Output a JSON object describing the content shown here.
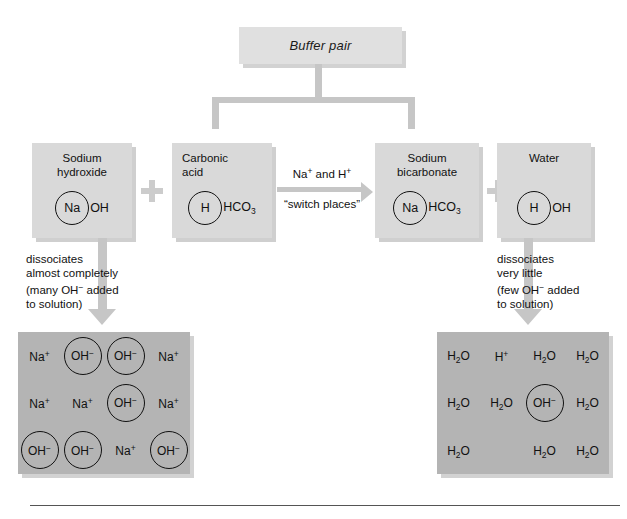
{
  "title": "Buffer pair",
  "banner": {
    "label": "Buffer pair"
  },
  "reactants": [
    {
      "name": "sodium-hydroxide",
      "caption_line1": "Sodium",
      "caption_line2": "hydroxide",
      "ring": "Na",
      "tail": "OH"
    },
    {
      "name": "carbonic-acid",
      "caption_line1": "Carbonic",
      "caption_line2": "acid",
      "ring": "H",
      "tail": "HCO",
      "tail_sub": "3"
    },
    {
      "name": "sodium-bicarbonate",
      "caption_line1": "Sodium",
      "caption_line2": "bicarbonate",
      "ring": "Na",
      "tail": "HCO",
      "tail_sub": "3"
    },
    {
      "name": "water",
      "caption_line1": "Water",
      "caption_line2": "",
      "ring": "H",
      "tail": "OH"
    }
  ],
  "plus_symbols": [
    "+",
    "+"
  ],
  "reaction_arrow": {
    "above_pre": "Na",
    "above_sup1": "+",
    "above_mid": " and H",
    "above_sup2": "+",
    "below": "“switch places”"
  },
  "left_note": {
    "line1": "dissociates",
    "line2": "almost completely",
    "line3_pre": "(many OH",
    "line3_sup": "−",
    "line3_post": " added",
    "line4": "to solution)"
  },
  "right_note": {
    "line1": "dissociates",
    "line2": "very little",
    "line3_pre": "(few OH",
    "line3_sup": "−",
    "line3_post": " added",
    "line4": "to solution)"
  },
  "left_solution": {
    "name": "strong-base-solution",
    "cells": [
      {
        "text": "Na",
        "sup": "+",
        "sub": "",
        "circled": false
      },
      {
        "text": "OH",
        "sup": "−",
        "sub": "",
        "circled": true
      },
      {
        "text": "OH",
        "sup": "−",
        "sub": "",
        "circled": true
      },
      {
        "text": "Na",
        "sup": "+",
        "sub": "",
        "circled": false
      },
      {
        "text": "Na",
        "sup": "+",
        "sub": "",
        "circled": false
      },
      {
        "text": "Na",
        "sup": "+",
        "sub": "",
        "circled": false
      },
      {
        "text": "OH",
        "sup": "−",
        "sub": "",
        "circled": true
      },
      {
        "text": "Na",
        "sup": "+",
        "sub": "",
        "circled": false
      },
      {
        "text": "OH",
        "sup": "−",
        "sub": "",
        "circled": true
      },
      {
        "text": "OH",
        "sup": "−",
        "sub": "",
        "circled": true
      },
      {
        "text": "Na",
        "sup": "+",
        "sub": "",
        "circled": false
      },
      {
        "text": "OH",
        "sup": "−",
        "sub": "",
        "circled": true
      }
    ]
  },
  "right_solution": {
    "name": "water-solution",
    "cells": [
      {
        "text": "H",
        "sup": "",
        "sub": "2",
        "post": "O",
        "circled": false
      },
      {
        "text": "H",
        "sup": "+",
        "sub": "",
        "post": "",
        "circled": false
      },
      {
        "text": "H",
        "sup": "",
        "sub": "2",
        "post": "O",
        "circled": false
      },
      {
        "text": "H",
        "sup": "",
        "sub": "2",
        "post": "O",
        "circled": false
      },
      {
        "text": "H",
        "sup": "",
        "sub": "2",
        "post": "O",
        "circled": false
      },
      {
        "text": "H",
        "sup": "",
        "sub": "2",
        "post": "O",
        "circled": false
      },
      {
        "text": "OH",
        "sup": "−",
        "sub": "",
        "post": "",
        "circled": true
      },
      {
        "text": "H",
        "sup": "",
        "sub": "2",
        "post": "O",
        "circled": false
      },
      {
        "text": "H",
        "sup": "",
        "sub": "2",
        "post": "O",
        "circled": false
      },
      {
        "text": "",
        "sup": "",
        "sub": "",
        "post": "",
        "circled": false
      },
      {
        "text": "H",
        "sup": "",
        "sub": "2",
        "post": "O",
        "circled": false
      },
      {
        "text": "H",
        "sup": "",
        "sub": "2",
        "post": "O",
        "circled": false
      }
    ]
  },
  "colors": {
    "reactant_box": "#d9d9d9",
    "solution_box": "#b4b4b4",
    "connector": "#c6c6c6",
    "banner": "#e0e0e0",
    "shadow": "#cfcfcf",
    "rule": "#555555"
  }
}
